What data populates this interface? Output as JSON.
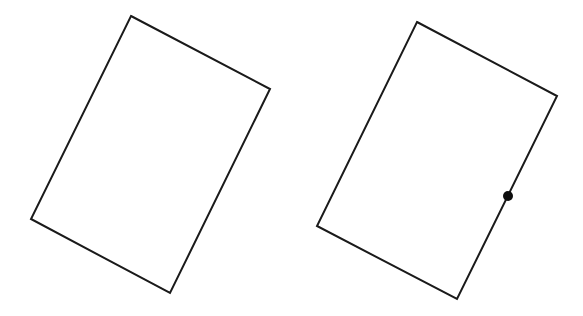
{
  "canvas": {
    "width": 583,
    "height": 316,
    "background": "#ffffff"
  },
  "shapes": [
    {
      "id": "rectangle-left",
      "type": "rotated-rectangle",
      "stroke": "#1a1a1a",
      "points": [
        [
          131,
          16
        ],
        [
          270,
          89
        ],
        [
          170,
          293
        ],
        [
          31,
          219
        ]
      ]
    },
    {
      "id": "rectangle-right",
      "type": "rotated-rectangle",
      "stroke": "#1a1a1a",
      "points": [
        [
          417,
          22
        ],
        [
          557,
          96
        ],
        [
          457,
          299
        ],
        [
          317,
          226
        ]
      ],
      "marker": {
        "cx": 508,
        "cy": 196,
        "r": 5,
        "color": "#0d0d0d"
      }
    }
  ]
}
